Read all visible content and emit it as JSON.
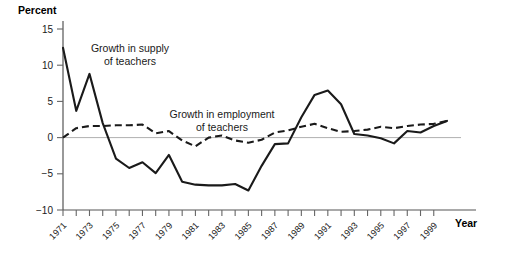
{
  "chart_data": {
    "type": "line",
    "title": "",
    "xlabel": "Year",
    "ylabel": "Percent",
    "ylim": [
      -10,
      15
    ],
    "yticks": [
      15,
      10,
      5,
      0,
      -5,
      -10
    ],
    "ytick_labels": [
      "15",
      "10",
      "5",
      "0",
      "−5",
      "−10"
    ],
    "grid": false,
    "zero_line": true,
    "legend": "annotations",
    "x": [
      1971,
      1972,
      1973,
      1974,
      1975,
      1976,
      1977,
      1978,
      1979,
      1980,
      1981,
      1982,
      1983,
      1984,
      1985,
      1986,
      1987,
      1988,
      1989,
      1990,
      1991,
      1992,
      1993,
      1994,
      1995,
      1996,
      1997,
      1998,
      1999,
      2000
    ],
    "xtick_labels": [
      "1971",
      "1973",
      "1975",
      "1977",
      "1979",
      "1981",
      "1983",
      "1985",
      "1987",
      "1989",
      "1991",
      "1993",
      "1995",
      "1997",
      "1999"
    ],
    "xtick_values": [
      1971,
      1973,
      1975,
      1977,
      1979,
      1981,
      1983,
      1985,
      1987,
      1989,
      1991,
      1993,
      1995,
      1997,
      1999
    ],
    "series": [
      {
        "name": "Growth in supply of teachers",
        "style": "solid",
        "values": [
          12.4,
          3.7,
          8.8,
          2.0,
          -2.9,
          -4.2,
          -3.4,
          -4.9,
          -2.4,
          -6.1,
          -6.5,
          -6.6,
          -6.6,
          -6.4,
          -7.3,
          -3.9,
          -0.9,
          -0.8,
          2.8,
          5.9,
          6.5,
          4.6,
          0.5,
          0.3,
          -0.1,
          -0.8,
          0.9,
          0.7,
          1.6,
          2.3
        ]
      },
      {
        "name": "Growth in employment of teachers",
        "style": "dashed",
        "values": [
          0.0,
          1.3,
          1.6,
          1.6,
          1.7,
          1.7,
          1.8,
          0.6,
          0.9,
          -0.4,
          -1.2,
          0.0,
          0.3,
          -0.4,
          -0.7,
          -0.3,
          0.7,
          1.0,
          1.5,
          1.9,
          1.3,
          0.8,
          0.9,
          1.1,
          1.5,
          1.3,
          1.6,
          1.8,
          1.9,
          2.3
        ]
      }
    ],
    "annotations": [
      {
        "name": "supply-annotation",
        "lines": [
          "Growth in supply",
          "of teachers"
        ],
        "x_px": 130,
        "y_px": 52
      },
      {
        "name": "employment-annotation",
        "lines": [
          "Growth in employment",
          "of teachers"
        ],
        "x_px": 222,
        "y_px": 118
      }
    ],
    "colors": {
      "series_line": "#1a1a1a",
      "axis": "#555555",
      "zero_line": "#b0b0b0",
      "text": "#1a1a1a",
      "background": "#ffffff"
    },
    "plot_box_px": {
      "left": 63,
      "right": 447,
      "top": 29,
      "bottom": 210,
      "axis_right_end": 476
    }
  }
}
